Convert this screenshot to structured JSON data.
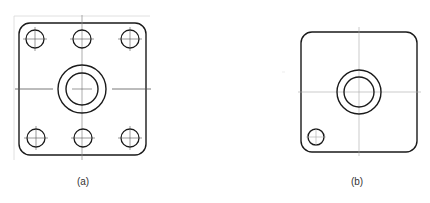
{
  "figures": [
    {
      "id": "a",
      "caption": "(a)",
      "description": "Square flange plate with rounded corners, central boss with two concentric circles, and six bolt holes (three top, three bottom) with centerlines"
    },
    {
      "id": "b",
      "caption": "(b)",
      "description": "Square plate with rounded corners, central boss with two concentric circles, and one hole at lower-left corner"
    }
  ],
  "colors": {
    "outline": "#1a1a1a",
    "centerline": "#9a9a9a",
    "background": "#ffffff"
  }
}
